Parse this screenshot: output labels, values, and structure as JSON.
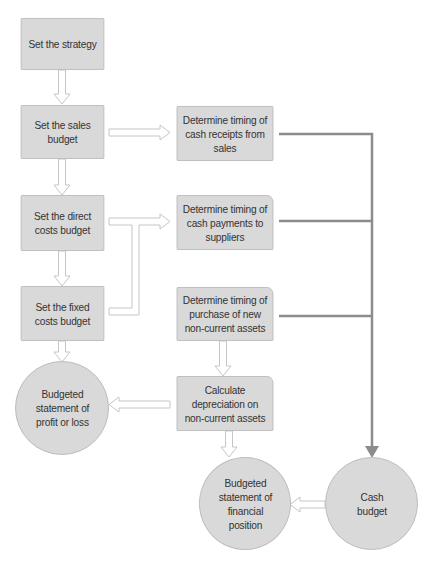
{
  "diagram": {
    "type": "flowchart",
    "colors": {
      "node_fill": "#d9d9d9",
      "node_border": "#bdbdbd",
      "text": "#333333",
      "hollow_arrow_stroke": "#c6c6c6",
      "cash_line": "#8c8c8c"
    },
    "nodes": {
      "strategy": {
        "label": "Set the strategy",
        "shape": "rectangle"
      },
      "sales_budget": {
        "label": "Set the sales\nbudget",
        "shape": "rectangle"
      },
      "direct_costs": {
        "label": "Set the direct\ncosts budget",
        "shape": "rectangle"
      },
      "fixed_costs": {
        "label": "Set the fixed\ncosts budget",
        "shape": "rectangle"
      },
      "cash_receipts": {
        "label": "Determine timing of\ncash receipts from\nsales",
        "shape": "rectangle"
      },
      "cash_payments": {
        "label": "Determine timing of\ncash payments to\nsuppliers",
        "shape": "rounded-rectangle"
      },
      "asset_purchase": {
        "label": "Determine timing of\npurchase of new\nnon-current assets",
        "shape": "rounded-rectangle"
      },
      "depreciation": {
        "label": "Calculate\ndepreciation on\nnon-current assets",
        "shape": "rounded-rectangle"
      },
      "profit_loss": {
        "label": "Budgeted\nstatement of\nprofit or loss",
        "shape": "circle"
      },
      "financial_position": {
        "label": "Budgeted\nstatement of\nfinancial\nposition",
        "shape": "circle"
      },
      "cash_budget": {
        "label": "Cash\nbudget",
        "shape": "circle"
      }
    },
    "edges": [
      {
        "from": "strategy",
        "to": "sales_budget",
        "style": "hollow-arrow"
      },
      {
        "from": "sales_budget",
        "to": "direct_costs",
        "style": "hollow-arrow"
      },
      {
        "from": "sales_budget",
        "to": "cash_receipts",
        "style": "hollow-arrow"
      },
      {
        "from": "direct_costs",
        "to": "fixed_costs",
        "style": "hollow-arrow"
      },
      {
        "from": "direct_costs",
        "to": "cash_payments",
        "style": "hollow-arrow"
      },
      {
        "from": "fixed_costs",
        "to": "cash_payments",
        "style": "hollow-arrow"
      },
      {
        "from": "fixed_costs",
        "to": "profit_loss",
        "style": "hollow-arrow"
      },
      {
        "from": "asset_purchase",
        "to": "depreciation",
        "style": "hollow-arrow"
      },
      {
        "from": "depreciation",
        "to": "profit_loss",
        "style": "hollow-arrow"
      },
      {
        "from": "depreciation",
        "to": "financial_position",
        "style": "hollow-arrow"
      },
      {
        "from": "cash_budget",
        "to": "financial_position",
        "style": "hollow-arrow"
      },
      {
        "from": "cash_receipts",
        "to": "cash_budget",
        "style": "solid-line"
      },
      {
        "from": "cash_payments",
        "to": "cash_budget",
        "style": "solid-line"
      },
      {
        "from": "asset_purchase",
        "to": "cash_budget",
        "style": "solid-line"
      }
    ]
  }
}
